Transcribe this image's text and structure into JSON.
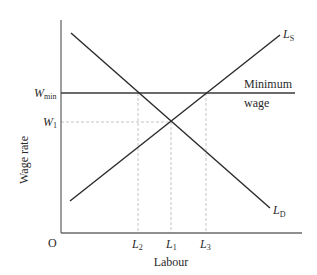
{
  "diagram": {
    "axes": {
      "origin_label": "O",
      "x_label": "Labour",
      "y_label": "Wage rate"
    },
    "y_ticks": {
      "w_min": {
        "main": "W",
        "sub": "min"
      },
      "w_1": {
        "main": "W",
        "sub": "1"
      }
    },
    "x_ticks": {
      "l2": {
        "main": "L",
        "sub": "2"
      },
      "l1": {
        "main": "L",
        "sub": "1"
      },
      "l3": {
        "main": "L",
        "sub": "3"
      }
    },
    "curves": {
      "supply": {
        "main": "L",
        "sub": "S"
      },
      "demand": {
        "main": "L",
        "sub": "D"
      }
    },
    "annotations": {
      "minimum_wage_line1": "Minimum",
      "minimum_wage_line2": "wage"
    },
    "colors": {
      "line": "#2a2a2a",
      "axis": "#6a6a6a",
      "dashed": "#bdbdbd"
    }
  }
}
